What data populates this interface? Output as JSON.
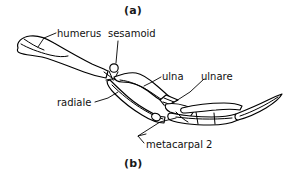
{
  "figure": {
    "type": "anatomical-line-drawing",
    "panels": [
      {
        "id": "a",
        "label": "(a)"
      },
      {
        "id": "b",
        "label": "(b)"
      }
    ],
    "annotations": [
      {
        "id": "humerus",
        "label": "humerus"
      },
      {
        "id": "sesamoid",
        "label": "sesamoid"
      },
      {
        "id": "ulna",
        "label": "ulna"
      },
      {
        "id": "ulnare",
        "label": "ulnare"
      },
      {
        "id": "radiale",
        "label": "radiale"
      },
      {
        "id": "metacarpal-2",
        "label": "metacarpal 2"
      }
    ],
    "colors": {
      "ink": "#000000",
      "background": "#ffffff",
      "text": "#111111"
    }
  }
}
